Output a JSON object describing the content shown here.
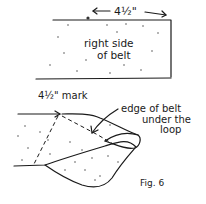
{
  "figure": {
    "caption": "Fig. 6",
    "top_panel": {
      "measurement_label": "4½\"",
      "belt_label_line1": "right side",
      "belt_label_line2": "of belt"
    },
    "bottom_panel": {
      "mark_label": "4½\" mark",
      "edge_label_line1": "edge of belt",
      "edge_label_line2": "under the",
      "edge_label_line3": "loop"
    }
  }
}
